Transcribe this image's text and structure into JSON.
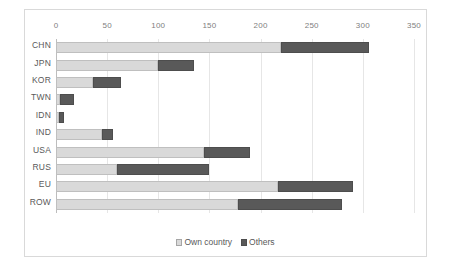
{
  "chart_data": {
    "type": "bar",
    "orientation": "horizontal",
    "stacked": true,
    "title": "",
    "xlabel": "",
    "ylabel": "",
    "xlim": [
      0,
      350
    ],
    "xticks": [
      0,
      50,
      100,
      150,
      200,
      250,
      300,
      350
    ],
    "grid": true,
    "legend_position": "bottom",
    "categories": [
      "CHN",
      "JPN",
      "KOR",
      "TWN",
      "IDN",
      "IND",
      "USA",
      "RUS",
      "EU",
      "ROW"
    ],
    "series": [
      {
        "name": "Own country",
        "color": "#d9d9d9",
        "values": [
          220,
          100,
          36,
          4,
          3,
          45,
          145,
          60,
          217,
          178
        ]
      },
      {
        "name": "Others",
        "color": "#595959",
        "values": [
          86,
          35,
          28,
          14,
          5,
          11,
          45,
          90,
          73,
          102
        ]
      }
    ],
    "totals": [
      306,
      135,
      64,
      18,
      8,
      56,
      190,
      150,
      290,
      280
    ]
  },
  "legend": {
    "items": [
      {
        "label": "Own country",
        "swatch": "own"
      },
      {
        "label": "Others",
        "swatch": "others"
      }
    ]
  },
  "axis": {
    "tick_labels": [
      "0",
      "50",
      "100",
      "150",
      "200",
      "250",
      "300",
      "350"
    ]
  }
}
